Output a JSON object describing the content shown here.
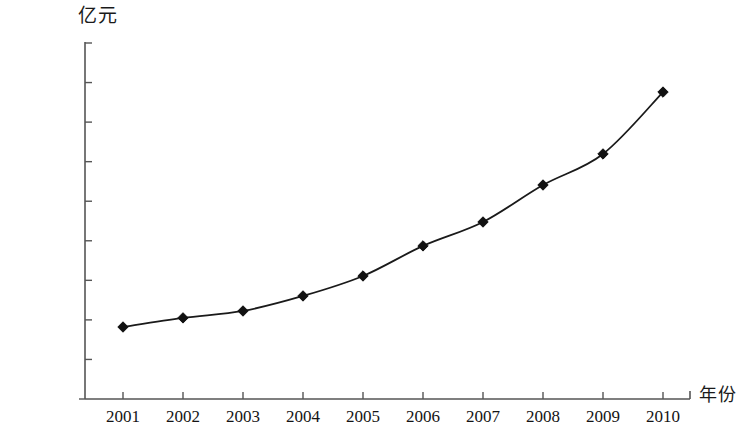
{
  "chart_data": {
    "type": "line",
    "title": "",
    "subtitle": "",
    "xlabel": "年份",
    "ylabel": "亿元",
    "categories": [
      "2001",
      "2002",
      "2003",
      "2004",
      "2005",
      "2006",
      "2007",
      "2008",
      "2009",
      "2010"
    ],
    "values": [
      36400,
      41000,
      44500,
      52100,
      62200,
      77400,
      89500,
      108200,
      123900,
      155200
    ],
    "series": [
      {
        "name": "",
        "values": [
          36400,
          41000,
          44500,
          52100,
          62200,
          77400,
          89500,
          108200,
          123900,
          155200
        ]
      }
    ],
    "ylim": [
      0,
      180000
    ],
    "y_ticks": [
      0,
      20000,
      40000,
      60000,
      80000,
      100000,
      120000,
      140000,
      160000,
      180000
    ],
    "y_tick_labels": [
      "0",
      "20 000",
      "40 000",
      "60 000",
      "80 000",
      "100 000",
      "120 000",
      "140 000",
      "160 000",
      "180 000"
    ],
    "x_tick_labels": [
      "2001",
      "2002",
      "2003",
      "2004",
      "2005",
      "2006",
      "2007",
      "2008",
      "2009",
      "2010"
    ],
    "grid": false,
    "legend": "none",
    "marker": "diamond",
    "line_color": "#1a1a1a",
    "marker_color": "#111111",
    "axis_color": "#555555",
    "background_color": "#ffffff"
  }
}
